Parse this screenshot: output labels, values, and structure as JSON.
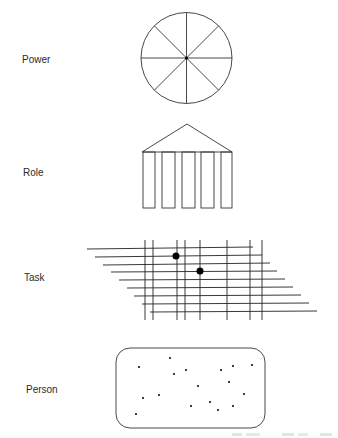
{
  "diagram": {
    "rows": [
      {
        "id": "power",
        "label": "Power",
        "label_pos": [
          22,
          54
        ],
        "icon": "wheel-icon"
      },
      {
        "id": "role",
        "label": "Role",
        "label_pos": [
          23,
          167
        ],
        "icon": "temple-icon"
      },
      {
        "id": "task",
        "label": "Task",
        "label_pos": [
          24,
          272
        ],
        "icon": "grid-icon"
      },
      {
        "id": "person",
        "label": "Person",
        "label_pos": [
          26,
          384
        ],
        "icon": "dotted-box-icon"
      }
    ],
    "power_wheel": {
      "cx": 186.5,
      "cy": 58,
      "r": 45.5,
      "spokes": 8
    },
    "role_temple": {
      "apex": [
        187,
        124
      ],
      "base_y": 152,
      "base_x": [
        142,
        232
      ],
      "column_bottom": 208,
      "columns": [
        [
          143,
          155
        ],
        [
          162,
          175
        ],
        [
          182,
          195
        ],
        [
          201,
          214
        ],
        [
          221,
          232
        ]
      ]
    },
    "task_grid": {
      "horizontal": [
        [
          87,
          249,
          253,
          247
        ],
        [
          95,
          257,
          262,
          255
        ],
        [
          103,
          265,
          270,
          263
        ],
        [
          111,
          272,
          277,
          271
        ],
        [
          119,
          280,
          285,
          279
        ],
        [
          127,
          288,
          293,
          287
        ],
        [
          134,
          296,
          301,
          295
        ],
        [
          142,
          304,
          309,
          303
        ],
        [
          150,
          312,
          317,
          311
        ]
      ],
      "vertical_x": [
        145,
        153,
        177,
        185,
        200,
        227,
        250,
        262
      ],
      "vertical_y": [
        240,
        320
      ],
      "dots": [
        [
          176,
          256
        ],
        [
          200,
          271
        ]
      ]
    },
    "person_box": {
      "x": 116,
      "y": 348,
      "w": 149,
      "h": 80,
      "rx": 14,
      "dots": [
        [
          139,
          367
        ],
        [
          170,
          358
        ],
        [
          186,
          370
        ],
        [
          174,
          374
        ],
        [
          221,
          370
        ],
        [
          233,
          366
        ],
        [
          252,
          365
        ],
        [
          229,
          382
        ],
        [
          198,
          386
        ],
        [
          244,
          394
        ],
        [
          159,
          395
        ],
        [
          143,
          398
        ],
        [
          210,
          402
        ],
        [
          191,
          406
        ],
        [
          233,
          406
        ],
        [
          218,
          410
        ],
        [
          136,
          414
        ]
      ]
    },
    "stroke_color": "#333333",
    "footer_fragment": "(cropped, illegible)"
  }
}
